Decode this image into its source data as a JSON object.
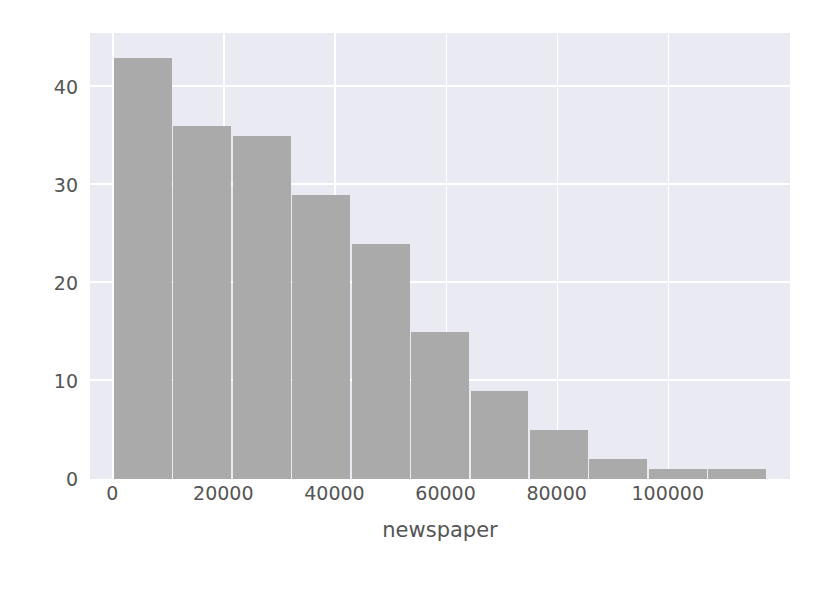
{
  "chart_data": {
    "type": "bar",
    "subtype": "histogram",
    "title": "",
    "xlabel": "newspaper",
    "ylabel": "",
    "grid": true,
    "legend": null,
    "xlim": [
      -4000,
      122000
    ],
    "ylim": [
      0,
      45.5
    ],
    "xticks": [
      0,
      20000,
      40000,
      60000,
      80000,
      100000
    ],
    "xtick_labels": [
      "0",
      "20000",
      "40000",
      "60000",
      "80000",
      "100000"
    ],
    "yticks": [
      0,
      10,
      20,
      30,
      40
    ],
    "ytick_labels": [
      "0",
      "10",
      "20",
      "30",
      "40"
    ],
    "bin_edges": [
      300,
      11000,
      21700,
      32400,
      43100,
      53800,
      64500,
      75200,
      85900,
      96600,
      107300,
      118000
    ],
    "bin_centers": [
      5650,
      16350,
      27050,
      37750,
      48450,
      59150,
      69850,
      80550,
      91250,
      101950,
      112650
    ],
    "values": [
      43,
      36,
      35,
      29,
      24,
      15,
      9,
      5,
      2,
      1,
      1
    ],
    "categories": [
      "300-11000",
      "11000-21700",
      "21700-32400",
      "32400-43100",
      "43100-53800",
      "53800-64500",
      "64500-75200",
      "75200-85900",
      "85900-96600",
      "96600-107300",
      "107300-118000"
    ],
    "colors": {
      "bar": "#aaaaaa",
      "axes_background": "#eaeaf2",
      "gridline": "#ffffff",
      "tick_text": "#555555",
      "figure_background": "#ffffff"
    }
  },
  "axis": {
    "x_label": "newspaper"
  }
}
